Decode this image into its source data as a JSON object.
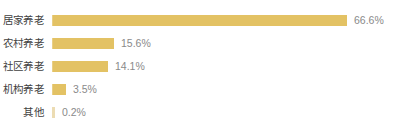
{
  "chart_data": {
    "type": "bar",
    "orientation": "horizontal",
    "title": "",
    "subtitle": "",
    "xlabel": "",
    "ylabel": "",
    "grid": false,
    "legend": null,
    "xlim": [
      0,
      100
    ],
    "unit": "%",
    "bar_color": "#e3c264",
    "tiny_bar_color": "#ecdcb3",
    "label_color": "#3f3f3f",
    "value_color": "#8a8a8a",
    "background": "#ffffff",
    "categories": [
      "居家养老",
      "农村养老",
      "社区养老",
      "机构养老",
      "其他"
    ],
    "values": [
      66.6,
      15.6,
      14.1,
      3.5,
      0.2
    ],
    "value_labels": [
      "66.6%",
      "15.6%",
      "14.1%",
      "3.5%",
      "0.2%"
    ],
    "bars": [
      {
        "category": "居家养老",
        "value": 66.6,
        "value_label": "66.6%",
        "width_px": 295
      },
      {
        "category": "农村养老",
        "value": 15.6,
        "value_label": "15.6%",
        "width_px": 62
      },
      {
        "category": "社区养老",
        "value": 14.1,
        "value_label": "14.1%",
        "width_px": 56
      },
      {
        "category": "机构养老",
        "value": 3.5,
        "value_label": "3.5%",
        "width_px": 14
      },
      {
        "category": "其他",
        "value": 0.2,
        "value_label": "0.2%",
        "width_px": 3
      }
    ]
  }
}
